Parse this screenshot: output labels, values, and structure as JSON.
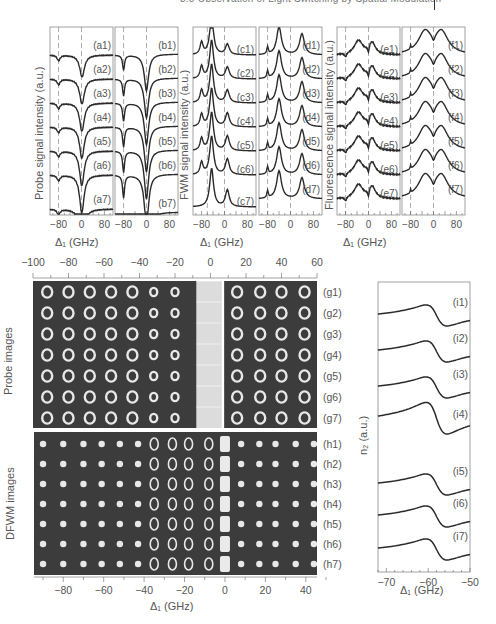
{
  "page_header": {
    "text": "3.5 Observation of Light Switching by Spatial Modulation",
    "page_bar": true
  },
  "chart_data": [
    {
      "id": "a",
      "type": "line",
      "title": "",
      "xlabel": "Δ1 (GHz)",
      "ylabel": "Probe signal intensity (a.u.)",
      "xticks": [
        "-80",
        "0",
        "80"
      ],
      "series_labels": [
        "(a1)",
        "(a2)",
        "(a3)",
        "(a4)",
        "(a5)",
        "(a6)",
        "(a7)"
      ],
      "description": "Probe transmission spectra showing small dip near -80 GHz and deep dip near 0 GHz",
      "dashed_lines_x": [
        -80,
        0
      ]
    },
    {
      "id": "b",
      "type": "line",
      "xlabel": "Δ1 (GHz)",
      "xticks": [
        "-80",
        "0",
        "80"
      ],
      "series_labels": [
        "(b1)",
        "(b2)",
        "(b3)",
        "(b4)",
        "(b5)",
        "(b6)",
        "(b7)"
      ],
      "description": "Theoretical probe spectra, dips at -80 and 0 GHz",
      "dashed_lines_x": [
        -80,
        0
      ]
    },
    {
      "id": "c",
      "type": "line",
      "xlabel": "Δ1 (GHz)",
      "ylabel": "FWM signal intensity (a.u.)",
      "xticks": [
        "-80",
        "0",
        "80"
      ],
      "series_labels": [
        "(c1)",
        "(c2)",
        "(c3)",
        "(c4)",
        "(c5)",
        "(c6)",
        "(c7)"
      ],
      "description": "FWM spectra: large peak near -40 GHz, smaller peak near +10 GHz",
      "dashed_lines_x": [
        -60,
        0
      ]
    },
    {
      "id": "d",
      "type": "line",
      "xlabel": "Δ1 (GHz)",
      "xticks": [
        "-80",
        "0",
        "80"
      ],
      "series_labels": [
        "(d1)",
        "(d2)",
        "(d3)",
        "(d4)",
        "(d5)",
        "(d6)",
        "(d7)"
      ],
      "description": "Theoretical FWM spectra: peaks at about -40 and +40 GHz",
      "dashed_lines_x": [
        -80,
        0
      ]
    },
    {
      "id": "e",
      "type": "line",
      "xlabel": "Δ1 (GHz)",
      "ylabel": "Fluorescence signal intensity (a.u.)",
      "xticks": [
        "-80",
        "0",
        "80"
      ],
      "series_labels": [
        "(e1)",
        "(e2)",
        "(e3)",
        "(e4)",
        "(e5)",
        "(e6)",
        "(e7)"
      ],
      "description": "Fluorescence spectra: double peak with dip at 0 GHz",
      "dashed_lines_x": [
        -80,
        0
      ]
    },
    {
      "id": "f",
      "type": "line",
      "xlabel": "Δ1 (GHz)",
      "xticks": [
        "-80",
        "0",
        "80"
      ],
      "series_labels": [
        "(f1)",
        "(f2)",
        "(f3)",
        "(f4)",
        "(f5)",
        "(f6)",
        "(f7)"
      ],
      "description": "Theoretical fluorescence spectra: peaks at about -30 and +25 GHz with dip at 0",
      "dashed_lines_x": [
        -80,
        0
      ]
    },
    {
      "id": "g",
      "type": "heatmap",
      "ylabel": "Probe images",
      "xticks_top": [
        "-100",
        "-80",
        "-60",
        "-40",
        "-20",
        "0",
        "20",
        "40",
        "60"
      ],
      "row_labels": [
        "(g1)",
        "(g2)",
        "(g3)",
        "(g4)",
        "(g5)",
        "(g6)",
        "(g7)"
      ],
      "columns": 12,
      "description": "Grid of probe beam spatial images versus detuning"
    },
    {
      "id": "h",
      "type": "heatmap",
      "ylabel": "DFWM images",
      "xlabel": "Δ1 (GHz)",
      "xticks": [
        "-80",
        "-60",
        "-40",
        "-20",
        "0",
        "20",
        "40"
      ],
      "row_labels": [
        "(h1)",
        "(h2)",
        "(h3)",
        "(h4)",
        "(h5)",
        "(h6)",
        "(h7)"
      ],
      "columns": 15,
      "description": "Grid of DFWM beam spatial images versus detuning"
    },
    {
      "id": "i",
      "type": "line",
      "xlabel": "Δ1 (GHz)",
      "ylabel": "n2 (a.u.)",
      "xticks": [
        "-70",
        "-60",
        "-50"
      ],
      "xlim": [
        -72,
        -50
      ],
      "series_labels": [
        "(i1)",
        "(i2)",
        "(i3)",
        "(i4)",
        "(i5)",
        "(i6)",
        "(i7)"
      ],
      "description": "Dispersive n2 curves: maximum near -61 GHz, minimum near -55 GHz"
    }
  ],
  "labels": {
    "probe_ylabel": "Probe signal intensity (a.u.)",
    "fwm_ylabel": "FWM signal intensity (a.u.)",
    "fl_ylabel": "Fluorescence signal intensity (a.u.)",
    "delta_xlabel": "Δ₁ (GHz)",
    "probe_images": "Probe images",
    "dfwm_images": "DFWM images",
    "n2_ylabel": "n₂ (a.u.)",
    "small_ticks": [
      "-80",
      "0",
      "80"
    ],
    "g_top_ticks": [
      "−100",
      "−80",
      "−60",
      "−40",
      "−20",
      "0",
      "20",
      "40",
      "60"
    ],
    "h_bottom_ticks": [
      "−80",
      "−60",
      "−40",
      "−20",
      "0",
      "20",
      "40"
    ],
    "i_ticks": [
      "−70",
      "−60",
      "−50"
    ]
  },
  "colors": {
    "line": "#2a2a2a",
    "frame": "#8a8a8a",
    "dashed": "#888888",
    "image_bg": "#3c3c3c",
    "spot": "#e8e8e8"
  }
}
